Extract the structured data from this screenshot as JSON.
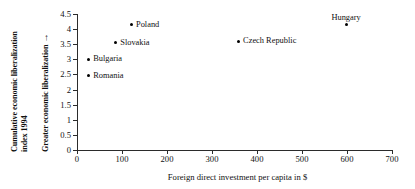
{
  "chart_data": {
    "type": "scatter",
    "title": "",
    "xlabel": "Foreign direct investment per capita in $",
    "ylabel": "Cumulative economic liberalization index 1994",
    "ylabel_secondary": "Greater economic liberalization",
    "ylabel_secondary_arrow": "→",
    "xlim": [
      0,
      700
    ],
    "ylim": [
      0,
      4.5
    ],
    "xticks": [
      "0",
      "100",
      "200",
      "300",
      "400",
      "500",
      "600",
      "700"
    ],
    "xtick_values": [
      0,
      100,
      200,
      300,
      400,
      500,
      600,
      700
    ],
    "yticks": [
      "0",
      "0.5",
      "1",
      "1.5",
      "2",
      "2.5",
      "3",
      "3.5",
      "4",
      "4.5"
    ],
    "ytick_values": [
      0,
      0.5,
      1,
      1.5,
      2,
      2.5,
      3,
      3.5,
      4,
      4.5
    ],
    "grid": false,
    "legend": false,
    "marker": "filled-diamond",
    "marker_color": "#000000",
    "points": [
      {
        "label": "Romania",
        "x": 25,
        "y": 2.45,
        "label_pos": "right"
      },
      {
        "label": "Bulgaria",
        "x": 25,
        "y": 3.0,
        "label_pos": "right"
      },
      {
        "label": "Slovakia",
        "x": 85,
        "y": 3.55,
        "label_pos": "right"
      },
      {
        "label": "Poland",
        "x": 120,
        "y": 4.15,
        "label_pos": "right"
      },
      {
        "label": "Czech Republic",
        "x": 358,
        "y": 3.6,
        "label_pos": "right"
      },
      {
        "label": "Hungary",
        "x": 598,
        "y": 4.15,
        "label_pos": "above"
      }
    ]
  }
}
